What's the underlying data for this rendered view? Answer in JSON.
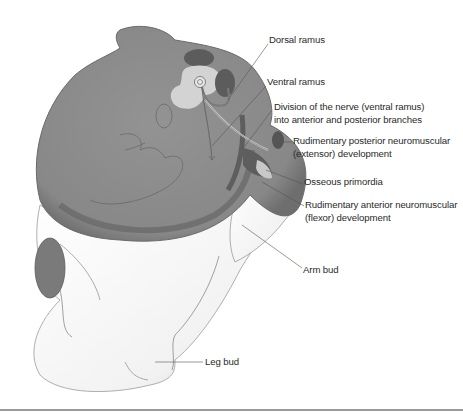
{
  "figure": {
    "colors": {
      "body_section": "#8c8c8c",
      "body_edge": "#6b6b6b",
      "dark_structures": "#555555",
      "light_structures": "#d2d2d2",
      "skin_white": "#f4f4f4",
      "leader_line": "#555555",
      "label_text": "#2a2a2a",
      "bottom_rule": "#9a9a9a"
    }
  },
  "labels": [
    {
      "id": "dorsal-ramus",
      "lines": [
        "Dorsal ramus"
      ]
    },
    {
      "id": "ventral-ramus",
      "lines": [
        "Ventral ramus"
      ]
    },
    {
      "id": "division-of-nerve",
      "lines": [
        "Division of the nerve (ventral ramus)",
        "into anterior and posterior branches"
      ]
    },
    {
      "id": "rudimentary-posterior",
      "lines": [
        "Rudimentary posterior neuromuscular",
        "(extensor) development"
      ]
    },
    {
      "id": "osseous-primordia",
      "lines": [
        "Osseous primordia"
      ]
    },
    {
      "id": "rudimentary-anterior",
      "lines": [
        "Rudimentary anterior neuromuscular",
        "(flexor) development"
      ]
    },
    {
      "id": "arm-bud",
      "lines": [
        "Arm bud"
      ]
    },
    {
      "id": "leg-bud",
      "lines": [
        "Leg bud"
      ]
    }
  ]
}
